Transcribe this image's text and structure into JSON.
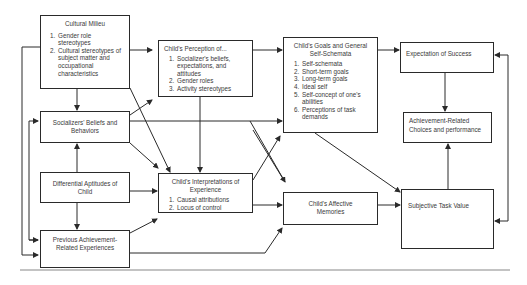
{
  "boxes": {
    "cultural_milieu": {
      "title": "Cultural Milieu",
      "items": [
        "Gender role stereotypes",
        "Cultural stereotypes of subject matter and occupational characteristics"
      ]
    },
    "socializers": {
      "title": "Socializers' Beliefs and Behaviors"
    },
    "differential": {
      "title": "Differential Aptitudes of Child"
    },
    "previous": {
      "title": "Previous Achievement-Related Experiences"
    },
    "perception": {
      "title": "Child's Perception of...",
      "items": [
        "Socializer's beliefs, expectations, and attitudes",
        "Gender roles",
        "Activity stereotypes"
      ]
    },
    "interpretations": {
      "title": "Child's Interpretations of Experience",
      "items": [
        "Causal attributions",
        "Locus of control"
      ]
    },
    "goals": {
      "title": "Child's Goals and General Self-Schemata",
      "items": [
        "Self-schemata",
        "Short-term goals",
        "Long-term goals",
        "Ideal self",
        "Self-concept of one's abilities",
        "Perceptions of task demands"
      ]
    },
    "affective": {
      "title": "Child's Affective Memories"
    },
    "expectation": {
      "title": "Expectation of Success"
    },
    "achievement": {
      "title": "Achievement-Related Choices and performance"
    },
    "task_value": {
      "title": "Subjective Task Value"
    }
  },
  "colors": {
    "line": "#2a2a2a",
    "text": "#3a3a3a",
    "background": "#ffffff",
    "separator": "#888888"
  }
}
